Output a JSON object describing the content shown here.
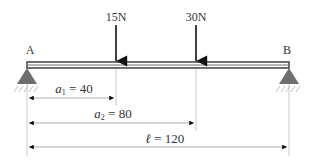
{
  "diagram": {
    "type": "simply-supported-beam",
    "supports": {
      "left_label": "A",
      "right_label": "B"
    },
    "loads": [
      {
        "label": "15N",
        "position": 40
      },
      {
        "label": "30N",
        "position": 80
      }
    ],
    "dimensions": [
      {
        "symbol": "a",
        "subscript": "1",
        "eq": " = 40",
        "value": 40
      },
      {
        "symbol": "a",
        "subscript": "2",
        "eq": " = 80",
        "value": 80
      },
      {
        "symbol": "ℓ",
        "subscript": "",
        "eq": " = 120",
        "value": 120
      }
    ],
    "colors": {
      "beam_outline": "#333333",
      "beam_fill": "#a0a0a0",
      "support": "#6e6e6e",
      "arrow": "#111111",
      "dim_line": "#9a9a9a",
      "text": "#333333"
    }
  }
}
